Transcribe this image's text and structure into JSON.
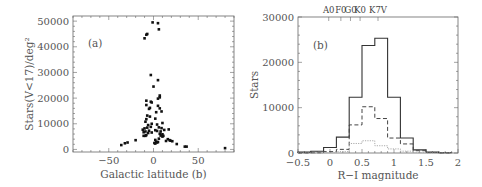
{
  "chart_data": [
    {
      "type": "scatter",
      "panel_label": "(a)",
      "title": "",
      "xlabel": "Galactic latitude (b)",
      "ylabel": "Stars(V<17)/deg²",
      "xlim": [
        -90,
        90
      ],
      "ylim": [
        -1000,
        52000
      ],
      "xticks": [
        -50,
        0,
        50
      ],
      "xtick_labels": [
        "−50",
        "0",
        "50"
      ],
      "yticks": [
        0,
        10000,
        20000,
        30000,
        40000,
        50000
      ],
      "ytick_labels": [
        "0",
        "10000",
        "20000",
        "30000",
        "40000",
        "50000"
      ],
      "grid": false,
      "series": [
        {
          "name": "fields",
          "points": [
            [
              -1,
              49500
            ],
            [
              5,
              49200
            ],
            [
              6,
              46800
            ],
            [
              -7,
              45000
            ],
            [
              -8,
              44700
            ],
            [
              -10,
              43300
            ],
            [
              -3,
              29000
            ],
            [
              5,
              27000
            ],
            [
              0,
              24500
            ],
            [
              7,
              21000
            ],
            [
              7,
              20300
            ],
            [
              5,
              19800
            ],
            [
              -8,
              19000
            ],
            [
              -3,
              18600
            ],
            [
              -2,
              18300
            ],
            [
              -8,
              17300
            ],
            [
              5,
              17000
            ],
            [
              7,
              16000
            ],
            [
              -4,
              16200
            ],
            [
              -5,
              15800
            ],
            [
              9,
              14800
            ],
            [
              3,
              14500
            ],
            [
              -7,
              13200
            ],
            [
              -4,
              12800
            ],
            [
              2,
              12000
            ],
            [
              -8,
              11800
            ],
            [
              10,
              10300
            ],
            [
              -9,
              10800
            ],
            [
              -2,
              10000
            ],
            [
              4,
              9700
            ],
            [
              -6,
              9500
            ],
            [
              -10,
              8200
            ],
            [
              -7,
              8500
            ],
            [
              -3,
              8800
            ],
            [
              6,
              8600
            ],
            [
              9,
              8300
            ],
            [
              -12,
              7700
            ],
            [
              2,
              7500
            ],
            [
              12,
              7600
            ],
            [
              -9,
              7000
            ],
            [
              -5,
              7300
            ],
            [
              4,
              7200
            ],
            [
              8,
              7000
            ],
            [
              17,
              7800
            ],
            [
              -11,
              6700
            ],
            [
              -6,
              6400
            ],
            [
              -2,
              6600
            ],
            [
              7,
              6100
            ],
            [
              10,
              5900
            ],
            [
              -8,
              5600
            ],
            [
              11,
              5300
            ],
            [
              -11,
              5300
            ],
            [
              -9,
              5300
            ],
            [
              8,
              5400
            ],
            [
              10,
              5000
            ],
            [
              6,
              4200
            ],
            [
              16,
              4000
            ],
            [
              2,
              3700
            ],
            [
              18,
              3600
            ],
            [
              19,
              3400
            ],
            [
              21,
              3200
            ],
            [
              14,
              3300
            ],
            [
              3,
              3000
            ],
            [
              4,
              2700
            ],
            [
              1,
              2500
            ],
            [
              5,
              2900
            ],
            [
              2,
              2300
            ],
            [
              26,
              2100
            ],
            [
              -20,
              3600
            ],
            [
              -29,
              2700
            ],
            [
              -32,
              2400
            ],
            [
              -36,
              1700
            ],
            [
              35,
              1100
            ],
            [
              37,
              1100
            ],
            [
              80,
              500
            ]
          ]
        }
      ]
    },
    {
      "type": "bar",
      "subtype": "step-histogram",
      "panel_label": "(b)",
      "title": "",
      "xlabel": "R−I magnitude",
      "ylabel": "Stars",
      "xlim": [
        -0.5,
        2
      ],
      "ylim": [
        0,
        30000
      ],
      "xticks": [
        -0.5,
        0,
        0.5,
        1,
        1.5,
        2
      ],
      "xtick_labels": [
        "−0.5",
        "0",
        "0.5",
        "1",
        "1.5",
        "2"
      ],
      "yticks": [
        0,
        10000,
        20000,
        30000
      ],
      "ytick_labels": [
        "0",
        "10000",
        "20000",
        "30000"
      ],
      "top_axis_labels": [
        {
          "label": "A0",
          "x": -0.02
        },
        {
          "label": "F0",
          "x": 0.17
        },
        {
          "label": "G0",
          "x": 0.32
        },
        {
          "label": "K0",
          "x": 0.47
        },
        {
          "label": "K7V",
          "x": 0.75
        }
      ],
      "grid": false,
      "bin_edges": [
        -0.5,
        -0.3,
        -0.1,
        0.1,
        0.3,
        0.5,
        0.7,
        0.9,
        1.1,
        1.3,
        1.5,
        1.7,
        1.9
      ],
      "series": [
        {
          "name": "total",
          "style": "solid",
          "color": "#333333",
          "values": [
            200,
            400,
            1200,
            3500,
            12300,
            23700,
            25300,
            12300,
            3300,
            700,
            200,
            50
          ]
        },
        {
          "name": "subset-dashed",
          "style": "dashed",
          "color": "#444444",
          "values": [
            0,
            50,
            300,
            800,
            6200,
            10200,
            7600,
            3300,
            2000,
            500,
            100,
            0
          ]
        },
        {
          "name": "subset-dotted",
          "style": "dotted",
          "color": "#aaaaaa",
          "values": [
            0,
            0,
            100,
            300,
            2100,
            2700,
            1600,
            900,
            400,
            100,
            0,
            0
          ]
        }
      ]
    }
  ]
}
